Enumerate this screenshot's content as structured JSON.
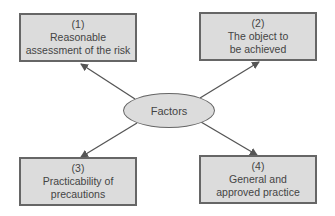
{
  "diagram": {
    "center": {
      "label": "Factors"
    },
    "boxes": [
      {
        "number": "(1)",
        "line1": "Reasonable",
        "line2": "assessment of the risk"
      },
      {
        "number": "(2)",
        "line1": "The object to",
        "line2": "be achieved"
      },
      {
        "number": "(3)",
        "line1": "Practicability of",
        "line2": "precautions"
      },
      {
        "number": "(4)",
        "line1": "General and",
        "line2": "approved practice"
      }
    ],
    "colors": {
      "fill": "#dcdcdc",
      "stroke": "#666666",
      "arrow": "#555555",
      "text": "#444444"
    }
  }
}
